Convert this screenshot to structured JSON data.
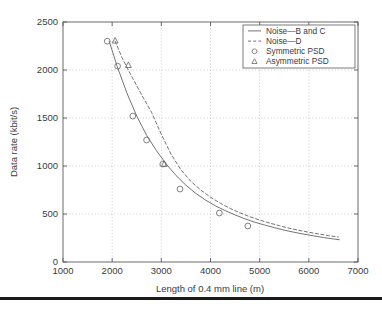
{
  "chart_data": {
    "type": "line",
    "title": "",
    "xlabel": "Length of 0.4 mm line (m)",
    "ylabel": "Data rate (kbit/s)",
    "xlim": [
      1000,
      7000
    ],
    "ylim": [
      0,
      2500
    ],
    "xticks": [
      1000,
      2000,
      3000,
      4000,
      5000,
      6000,
      7000
    ],
    "yticks": [
      0,
      500,
      1000,
      1500,
      2000,
      2500
    ],
    "grid": true,
    "grid_style": "dotted",
    "legend_position": "top-right",
    "series": [
      {
        "name": "Noise—B and C",
        "style": "solid",
        "marker": "none",
        "x": [
          1940,
          2100,
          2300,
          2500,
          2700,
          2900,
          3100,
          3300,
          3500,
          3700,
          3900,
          4100,
          4300,
          4500,
          4700,
          4900,
          5100,
          5300,
          5500,
          5700,
          5900,
          6100,
          6300,
          6500,
          6620
        ],
        "y": [
          2300,
          2040,
          1760,
          1520,
          1320,
          1160,
          1020,
          900,
          800,
          715,
          645,
          585,
          535,
          490,
          450,
          415,
          385,
          358,
          332,
          310,
          290,
          272,
          255,
          240,
          232
        ]
      },
      {
        "name": "Noise—D",
        "style": "dashed",
        "marker": "none",
        "x": [
          2060,
          2200,
          2400,
          2600,
          2800,
          3000,
          3200,
          3400,
          3600,
          3800,
          4000,
          4200,
          4400,
          4600,
          4800,
          5000,
          5200,
          5400,
          5600,
          5800,
          6000,
          6200,
          6400,
          6600
        ],
        "y": [
          2300,
          2130,
          1930,
          1740,
          1560,
          1330,
          1120,
          960,
          840,
          750,
          675,
          612,
          558,
          512,
          472,
          437,
          406,
          378,
          352,
          330,
          310,
          292,
          275,
          260
        ]
      }
    ],
    "scatter": [
      {
        "name": "Symmetric PSD",
        "marker": "circle",
        "points": [
          {
            "x": 1900,
            "y": 2300
          },
          {
            "x": 2110,
            "y": 2040
          },
          {
            "x": 2420,
            "y": 1520
          },
          {
            "x": 2700,
            "y": 1270
          },
          {
            "x": 3030,
            "y": 1020
          },
          {
            "x": 3380,
            "y": 760
          },
          {
            "x": 4180,
            "y": 510
          },
          {
            "x": 4760,
            "y": 375
          }
        ]
      },
      {
        "name": "Asymmetric PSD",
        "marker": "triangle",
        "points": [
          {
            "x": 2060,
            "y": 2305
          },
          {
            "x": 2330,
            "y": 2050
          },
          {
            "x": 3060,
            "y": 1020
          }
        ]
      }
    ],
    "legend": [
      {
        "label": "Noise—B and C",
        "type": "line",
        "style": "solid"
      },
      {
        "label": "Noise—D",
        "type": "line",
        "style": "dashed"
      },
      {
        "label": "Symmetric PSD",
        "type": "marker",
        "style": "circle"
      },
      {
        "label": "Asymmetric PSD",
        "type": "marker",
        "style": "triangle"
      }
    ]
  },
  "colors": {
    "axis": "#5a5a5a",
    "grid": "#b9b9b9",
    "series": "#6b6b6b",
    "text": "#3b3b3b",
    "rule": "#1a1a1a",
    "background": "#ffffff"
  }
}
